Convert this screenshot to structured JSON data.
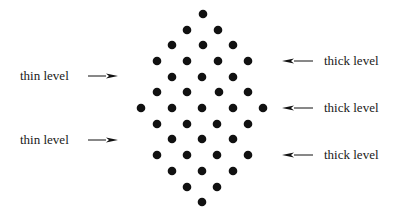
{
  "diagram": {
    "dot_color": "#111111",
    "dot_radius": 4.3,
    "arrow_color": "#111111",
    "dot_rows": [
      {
        "y": 14,
        "xs": [
          203
        ]
      },
      {
        "y": 30,
        "xs": [
          187,
          218
        ]
      },
      {
        "y": 45,
        "xs": [
          172,
          203,
          233
        ]
      },
      {
        "y": 61,
        "xs": [
          157,
          187,
          218,
          248
        ]
      },
      {
        "y": 77,
        "xs": [
          172,
          202,
          233
        ]
      },
      {
        "y": 92,
        "xs": [
          157,
          187,
          219,
          248
        ]
      },
      {
        "y": 108,
        "xs": [
          141,
          172,
          202,
          233,
          263
        ]
      },
      {
        "y": 124,
        "xs": [
          157,
          187,
          217,
          248
        ]
      },
      {
        "y": 139,
        "xs": [
          172,
          202,
          233
        ]
      },
      {
        "y": 155,
        "xs": [
          157,
          187,
          217,
          248
        ]
      },
      {
        "y": 171,
        "xs": [
          172,
          202,
          233
        ]
      },
      {
        "y": 187,
        "xs": [
          187,
          217
        ]
      },
      {
        "y": 202,
        "xs": [
          202
        ]
      }
    ],
    "left_labels": [
      {
        "text": "thin level",
        "y": 76,
        "arrow": {
          "x1": 88,
          "x2": 118,
          "direction": "right"
        }
      },
      {
        "text": "thin level",
        "y": 140,
        "arrow": {
          "x1": 88,
          "x2": 118,
          "direction": "right"
        }
      }
    ],
    "right_labels": [
      {
        "text": "thick level",
        "y": 61,
        "arrow": {
          "x1": 313,
          "x2": 282,
          "direction": "left"
        }
      },
      {
        "text": "thick level",
        "y": 108,
        "arrow": {
          "x1": 313,
          "x2": 282,
          "direction": "left"
        }
      },
      {
        "text": "thick level",
        "y": 155,
        "arrow": {
          "x1": 313,
          "x2": 282,
          "direction": "left"
        }
      }
    ]
  }
}
